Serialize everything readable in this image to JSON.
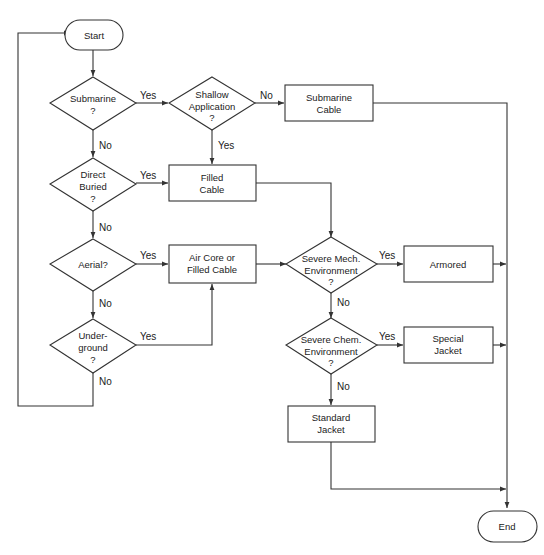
{
  "diagram": {
    "type": "flowchart",
    "colors": {
      "line": "#333333",
      "fill": "#ffffff",
      "text": "#222222"
    },
    "nodes": {
      "start": {
        "kind": "terminator",
        "lines": [
          "Start"
        ]
      },
      "submarine": {
        "kind": "decision",
        "lines": [
          "Submarine",
          "?"
        ]
      },
      "shallow": {
        "kind": "decision",
        "lines": [
          "Shallow",
          "Application",
          "?"
        ]
      },
      "submarine_cable": {
        "kind": "process",
        "lines": [
          "Submarine",
          "Cable"
        ]
      },
      "direct_buried": {
        "kind": "decision",
        "lines": [
          "Direct",
          "Buried",
          "?"
        ]
      },
      "filled_cable": {
        "kind": "process",
        "lines": [
          "Filled",
          "Cable"
        ]
      },
      "aerial": {
        "kind": "decision",
        "lines": [
          "Aerial?"
        ]
      },
      "air_core": {
        "kind": "process",
        "lines": [
          "Air Core or",
          "Filled Cable"
        ]
      },
      "underground": {
        "kind": "decision",
        "lines": [
          "Under-",
          "ground",
          "?"
        ]
      },
      "severe_mech": {
        "kind": "decision",
        "lines": [
          "Severe Mech.",
          "Environment",
          "?"
        ]
      },
      "armored": {
        "kind": "process",
        "lines": [
          "Armored"
        ]
      },
      "severe_chem": {
        "kind": "decision",
        "lines": [
          "Severe Chem.",
          "Environment",
          "?"
        ]
      },
      "special_jacket": {
        "kind": "process",
        "lines": [
          "Special",
          "Jacket"
        ]
      },
      "standard_jacket": {
        "kind": "process",
        "lines": [
          "Standard",
          "Jacket"
        ]
      },
      "end": {
        "kind": "terminator",
        "lines": [
          "End"
        ]
      }
    },
    "edges": [
      {
        "from": "start",
        "to": "submarine",
        "label": ""
      },
      {
        "from": "submarine",
        "to": "shallow",
        "label": "Yes"
      },
      {
        "from": "submarine",
        "to": "direct_buried",
        "label": "No"
      },
      {
        "from": "shallow",
        "to": "submarine_cable",
        "label": "No"
      },
      {
        "from": "shallow",
        "to": "filled_cable",
        "label": "Yes"
      },
      {
        "from": "direct_buried",
        "to": "filled_cable",
        "label": "Yes"
      },
      {
        "from": "direct_buried",
        "to": "aerial",
        "label": "No"
      },
      {
        "from": "aerial",
        "to": "air_core",
        "label": "Yes"
      },
      {
        "from": "aerial",
        "to": "underground",
        "label": "No"
      },
      {
        "from": "underground",
        "to": "air_core",
        "label": "Yes"
      },
      {
        "from": "underground",
        "to": "start",
        "label": "No"
      },
      {
        "from": "filled_cable",
        "to": "severe_mech",
        "label": ""
      },
      {
        "from": "air_core",
        "to": "severe_mech",
        "label": ""
      },
      {
        "from": "severe_mech",
        "to": "armored",
        "label": "Yes"
      },
      {
        "from": "severe_mech",
        "to": "severe_chem",
        "label": "No"
      },
      {
        "from": "severe_chem",
        "to": "special_jacket",
        "label": "Yes"
      },
      {
        "from": "severe_chem",
        "to": "standard_jacket",
        "label": "No"
      },
      {
        "from": "submarine_cable",
        "to": "end",
        "label": ""
      },
      {
        "from": "armored",
        "to": "end",
        "label": ""
      },
      {
        "from": "special_jacket",
        "to": "end",
        "label": ""
      },
      {
        "from": "standard_jacket",
        "to": "end",
        "label": ""
      }
    ],
    "edge_labels": {
      "yes": "Yes",
      "no": "No"
    }
  }
}
